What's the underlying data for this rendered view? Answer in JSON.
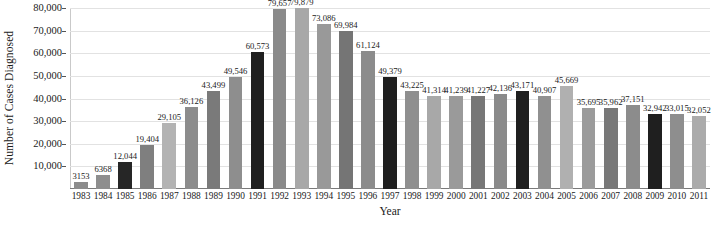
{
  "chart_data": {
    "type": "bar",
    "title": "",
    "xlabel": "Year",
    "ylabel": "Number of Cases Diagnosed",
    "ylim": [
      0,
      80000
    ],
    "ytick_values": [
      10000,
      20000,
      30000,
      40000,
      50000,
      60000,
      70000,
      80000
    ],
    "ytick_labels": [
      "10,000",
      "20,000",
      "30,000",
      "40,000",
      "50,000",
      "60,000",
      "70,000",
      "80,000"
    ],
    "grid": true,
    "legend": "none",
    "categories": [
      "1983",
      "1984",
      "1985",
      "1986",
      "1987",
      "1988",
      "1989",
      "1990",
      "1991",
      "1992",
      "1993",
      "1994",
      "1995",
      "1996",
      "1997",
      "1998",
      "1999",
      "2000",
      "2001",
      "2002",
      "2003",
      "2004",
      "2005",
      "2006",
      "2007",
      "2008",
      "2009",
      "2010",
      "2011"
    ],
    "values": [
      3153,
      6368,
      12044,
      19404,
      29105,
      36126,
      43499,
      49546,
      60573,
      79657,
      79879,
      73086,
      69984,
      61124,
      49379,
      43225,
      41314,
      41239,
      41227,
      42136,
      43171,
      40907,
      45669,
      35695,
      35962,
      37151,
      32942,
      33015,
      32052
    ],
    "value_labels": [
      "3153",
      "6368",
      "12,044",
      "19,404",
      "29,105",
      "36,126",
      "43,499",
      "49,546",
      "60,573",
      "79,657",
      "79,879",
      "73,086",
      "69,984",
      "61,124",
      "49,379",
      "43,225",
      "41,314",
      "41,239",
      "41,227",
      "42,136",
      "43,171",
      "40,907",
      "45,669",
      "35,695",
      "35,962",
      "37,151",
      "32,942",
      "33,015",
      "32,052"
    ],
    "bar_colors": [
      "#8c8c8c",
      "#8e8e8e",
      "#262626",
      "#7f7f7f",
      "#b3b3b3",
      "#8c8c8c",
      "#7a7a7a",
      "#8e8e8e",
      "#1f1f1f",
      "#8a8a8a",
      "#a8a8a8",
      "#999999",
      "#757575",
      "#8c8c8c",
      "#1f1f1f",
      "#8f8f8f",
      "#a8a8a8",
      "#9a9a9a",
      "#777777",
      "#8a8a8a",
      "#1f1f1f",
      "#909090",
      "#b0b0b0",
      "#9b9b9b",
      "#787878",
      "#8c8c8c",
      "#1f1f1f",
      "#8e8e8e",
      "#ababab"
    ],
    "colors": {
      "grid": "#e2e2e2",
      "axis": "#7a7a7a",
      "text": "#1a1a1a",
      "background": "#ffffff"
    }
  }
}
